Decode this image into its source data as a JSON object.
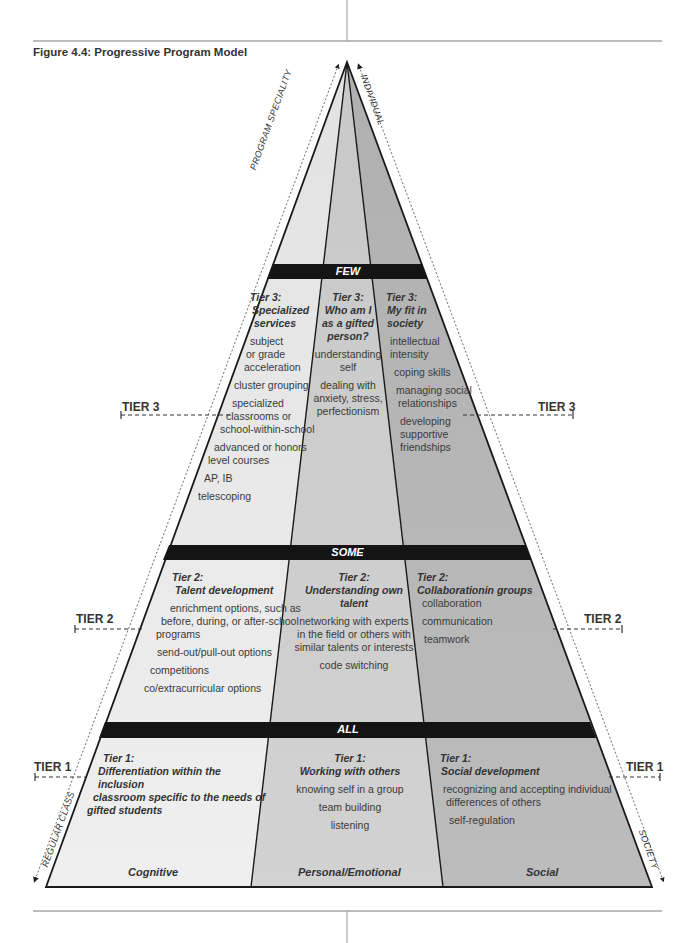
{
  "figure": {
    "title": "Figure 4.4: Progressive Program Model"
  },
  "colors": {
    "cognitive": "#ececec",
    "personal_emotional": "#cfcfcf",
    "social": "#b8b8b8",
    "band": "#141414",
    "outline": "#1a1a1a"
  },
  "axes": {
    "left_up": "PROGRAM SPECIALITY",
    "right_up": "INDIVIDUAL",
    "left_down": "REGULAR CLASS",
    "right_down": "SOCIETY"
  },
  "bands": {
    "few": "FEW",
    "some": "SOME",
    "all": "ALL"
  },
  "tier_markers": {
    "tier3_left": "TIER 3",
    "tier3_right": "TIER 3",
    "tier2_left": "TIER 2",
    "tier2_right": "TIER 2",
    "tier1_left": "TIER 1",
    "tier1_right": "TIER 1"
  },
  "domains": {
    "cognitive": "Cognitive",
    "personal": "Personal/Emotional",
    "social": "Social"
  },
  "tier3": {
    "cognitive": {
      "heading_1": "Tier 3:",
      "heading_2": "Specialized",
      "heading_3": "services",
      "items": [
        "subject",
        "or grade",
        "acceleration",
        "cluster grouping",
        "specialized",
        "classrooms or",
        "school-within-school",
        "advanced or honors",
        "level courses",
        "AP, IB",
        "telescoping"
      ]
    },
    "personal": {
      "heading_1": "Tier 3:",
      "heading_2": "Who am I",
      "heading_3": "as a gifted",
      "heading_4": "person?",
      "items": [
        "understanding",
        "self",
        "dealing with",
        "anxiety, stress,",
        "perfectionism"
      ]
    },
    "social": {
      "heading_1": "Tier 3:",
      "heading_2": "My fit in",
      "heading_3": "society",
      "items": [
        "intellectual",
        "intensity",
        "coping skills",
        "managing social",
        "relationships",
        "developing",
        "supportive",
        "friendships"
      ]
    }
  },
  "tier2": {
    "cognitive": {
      "heading_1": "Tier 2:",
      "heading_2": "Talent development",
      "items": [
        "enrichment options, such as",
        "before, during, or after-school",
        "programs",
        "send-out/pull-out options",
        "competitions",
        "co/extracurricular options"
      ]
    },
    "personal": {
      "heading_1": "Tier 2:",
      "heading_2": "Understanding own talent",
      "items": [
        "networking with experts",
        "in the field or others with",
        "similar talents or interests",
        "code switching"
      ]
    },
    "social": {
      "heading_1": "Tier 2:",
      "heading_2": "Collaborationin groups",
      "items": [
        "collaboration",
        "communication",
        "teamwork"
      ]
    }
  },
  "tier1": {
    "cognitive": {
      "heading_1": "Tier 1:",
      "heading_2": "Differentiation within the inclusion",
      "heading_3": "classroom specific to the needs of",
      "heading_4": "gifted students"
    },
    "personal": {
      "heading_1": "Tier 1:",
      "heading_2": "Working with others",
      "items": [
        "knowing self in a group",
        "team building",
        "listening"
      ]
    },
    "social": {
      "heading_1": "Tier 1:",
      "heading_2": "Social development",
      "items": [
        "recognizing and accepting individual",
        "differences of others",
        "self-regulation"
      ]
    }
  }
}
